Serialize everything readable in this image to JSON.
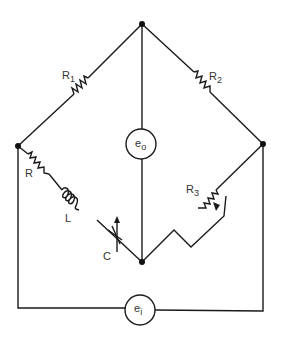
{
  "diagram": {
    "type": "AC bridge circuit",
    "components": {
      "R1": {
        "label": "R",
        "sub": "1"
      },
      "R2": {
        "label": "R",
        "sub": "2"
      },
      "R3": {
        "label": "R",
        "sub": "3"
      },
      "R": {
        "label": "R"
      },
      "L": {
        "label": "L"
      },
      "C": {
        "label": "C"
      },
      "eo": {
        "label": "e",
        "sub": "o"
      },
      "ei": {
        "label": "e",
        "sub": "i"
      }
    },
    "colors": {
      "line": "#1a1a1a",
      "text": "#333333",
      "background": "#ffffff"
    }
  }
}
